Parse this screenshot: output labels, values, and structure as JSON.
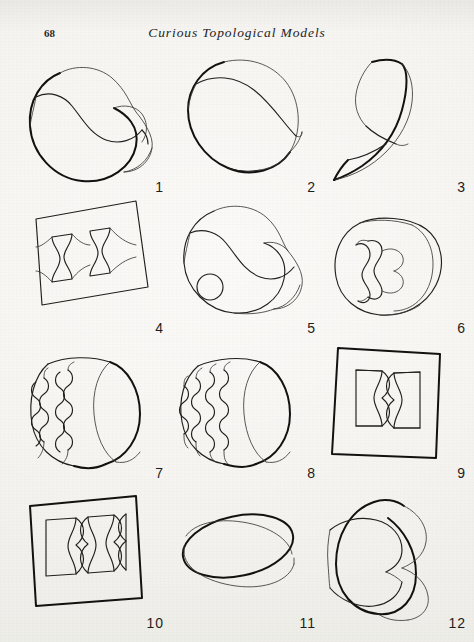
{
  "page": {
    "folio": "68",
    "running_head": "Curious Topological Models",
    "background_color": "#f5f3ef",
    "ink_color": "#1e1e1c"
  },
  "figures": [
    {
      "number": "1",
      "name": "twisted-band-loop",
      "description": "Closed band with a half twist forming a broad kidney-shaped loop"
    },
    {
      "number": "2",
      "name": "triangular-twisted-band",
      "description": "Closed band twisted into a rounded triangular loop"
    },
    {
      "number": "3",
      "name": "curved-ribbon-strip",
      "description": "Open curved ribbon strip bending back on itself"
    },
    {
      "number": "4",
      "name": "flat-sheet-two-hourglass-cutouts",
      "description": "Flat quadrilateral sheet with two hourglass shaped cutouts"
    },
    {
      "number": "5",
      "name": "twisted-band-with-hole",
      "description": "Twisted band loop pierced by a small circular hole"
    },
    {
      "number": "6",
      "name": "band-with-hourglass-slit",
      "description": "Cylindrical band with an hourglass slit cut through its face"
    },
    {
      "number": "7",
      "name": "cylinder-with-three-beaded-slits",
      "description": "Cylindrical band cut with three wavy beaded slits"
    },
    {
      "number": "8",
      "name": "cylinder-with-four-beaded-slits",
      "description": "Cylindrical band cut with four wavy beaded slits"
    },
    {
      "number": "9",
      "name": "square-sheet-one-beaded-window",
      "description": "Square sheet with rectangular window and one beaded column"
    },
    {
      "number": "10",
      "name": "square-sheet-two-beaded-columns",
      "description": "Square sheet with rectangular window and two beaded columns"
    },
    {
      "number": "11",
      "name": "plain-cylindrical-band",
      "description": "Plain untwisted cylindrical band seen in perspective"
    },
    {
      "number": "12",
      "name": "edge-on-twisted-band",
      "description": "Twisted band viewed nearly edge on"
    }
  ]
}
